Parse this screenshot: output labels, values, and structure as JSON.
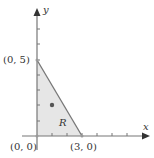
{
  "figure": {
    "type": "region-diagram",
    "axes": {
      "x_label": "x",
      "y_label": "y",
      "x_ticks": [
        1,
        2,
        3,
        4,
        5,
        6,
        7
      ],
      "y_ticks": [
        1,
        2,
        3,
        4,
        5,
        6,
        7
      ]
    },
    "region": {
      "label": "R",
      "vertices": [
        [
          0,
          0
        ],
        [
          3,
          0
        ],
        [
          0,
          5
        ]
      ],
      "fill_color": "#e6e6e6",
      "edge_color": "#777777"
    },
    "point": {
      "x": 1,
      "y": 2,
      "color": "#555555"
    },
    "vertex_labels": {
      "origin": "(0, 0)",
      "x_intercept": "(3, 0)",
      "y_intercept": "(0, 5)"
    },
    "colors": {
      "axis": "#777777",
      "text": "#333333"
    }
  }
}
